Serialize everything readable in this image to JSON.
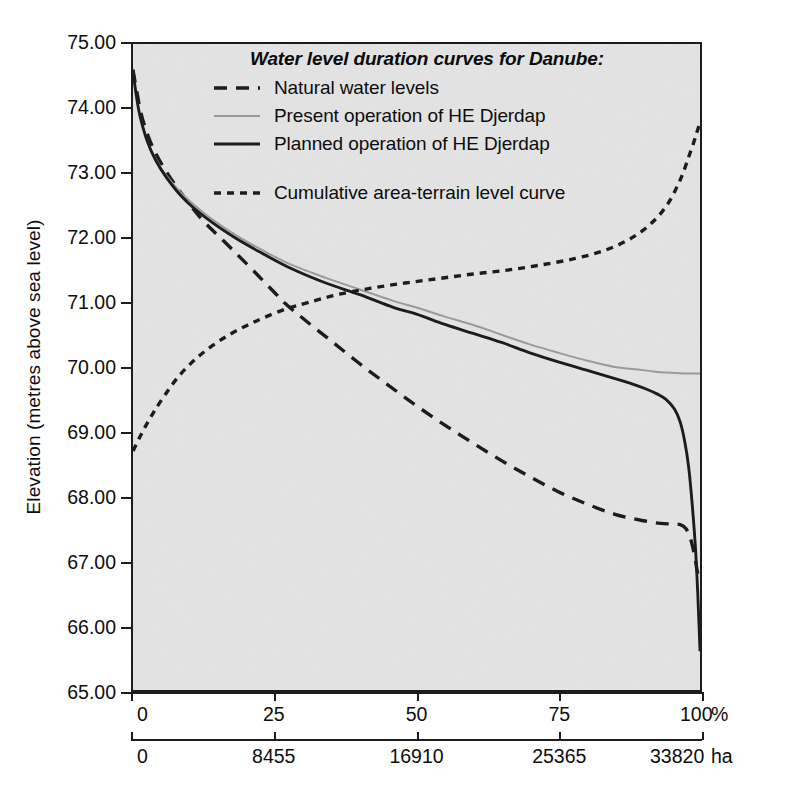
{
  "figure": {
    "ylabel": "Elevation (metres above sea level)",
    "legend_title": "Water level duration curves for Danube:",
    "pct_unit": "%",
    "ha_unit": "ha"
  },
  "legend": {
    "items": [
      {
        "label": "Natural water levels",
        "style": "long-dash",
        "color": "#1c1c1c"
      },
      {
        "label": "Present operation of HE Djerdap",
        "style": "thin-solid",
        "color": "#9a9a9a"
      },
      {
        "label": "Planned operation of HE Djerdap",
        "style": "thick-solid",
        "color": "#1c1c1c"
      },
      {
        "label": "Cumulative area-terrain level curve",
        "style": "short-dash",
        "color": "#1c1c1c"
      }
    ]
  },
  "chart_data": {
    "type": "line",
    "title": "Water level duration curves for Danube:",
    "xlabel": "",
    "ylabel": "Elevation (metres above sea level)",
    "xlim": [
      0,
      100
    ],
    "ylim": [
      65.0,
      75.0
    ],
    "grid": false,
    "legend_position": "top-right-inside",
    "background_color": "#e4e4e4",
    "axes": {
      "y": {
        "unit": "m a.s.l.",
        "ticks": [
          65.0,
          66.0,
          67.0,
          68.0,
          69.0,
          70.0,
          71.0,
          72.0,
          73.0,
          74.0,
          75.0
        ],
        "tick_labels": [
          "65.00",
          "66.00",
          "67.00",
          "68.00",
          "69.00",
          "70.00",
          "71.00",
          "72.00",
          "73.00",
          "74.00",
          "75.00"
        ]
      },
      "x_primary": {
        "unit": "%",
        "ticks": [
          0,
          25,
          50,
          75,
          100
        ],
        "tick_labels": [
          "0",
          "25",
          "50",
          "75",
          "100"
        ]
      },
      "x_secondary": {
        "unit": "ha",
        "ticks": [
          0,
          25,
          50,
          75,
          100
        ],
        "tick_labels": [
          "0",
          "8455",
          "16910",
          "25365",
          "33820"
        ],
        "values": [
          0,
          8455,
          16910,
          25365,
          33820
        ]
      }
    },
    "series": [
      {
        "name": "Natural water levels",
        "style": "long-dash",
        "color": "#1c1c1c",
        "x": [
          0,
          0.6,
          1.5,
          3,
          5,
          8,
          12,
          16,
          20,
          25,
          27,
          30,
          35,
          40,
          45,
          50,
          55,
          60,
          65,
          70,
          75,
          80,
          85,
          90,
          93,
          95,
          96.5,
          97.5,
          98.3,
          99,
          99.5,
          100
        ],
        "y": [
          74.6,
          74.3,
          73.9,
          73.5,
          73.15,
          72.75,
          72.3,
          71.95,
          71.6,
          71.15,
          70.97,
          70.75,
          70.4,
          70.05,
          69.72,
          69.4,
          69.1,
          68.82,
          68.55,
          68.3,
          68.07,
          67.88,
          67.72,
          67.62,
          67.58,
          67.57,
          67.56,
          67.5,
          67.35,
          67.1,
          66.85,
          66.68
        ]
      },
      {
        "name": "Present operation of HE Djerdap",
        "style": "thin-solid",
        "color": "#9a9a9a",
        "x": [
          0,
          0.5,
          1.2,
          2.5,
          4,
          6,
          9,
          13,
          18,
          23,
          28,
          34,
          40,
          46,
          50,
          55,
          60,
          65,
          70,
          75,
          80,
          85,
          88,
          91,
          93,
          95,
          97,
          98.5,
          100
        ],
        "y": [
          74.6,
          74.25,
          73.9,
          73.5,
          73.22,
          72.95,
          72.65,
          72.35,
          72.05,
          71.8,
          71.58,
          71.38,
          71.2,
          71.02,
          70.92,
          70.78,
          70.65,
          70.5,
          70.35,
          70.22,
          70.1,
          70.0,
          69.97,
          69.94,
          69.92,
          69.91,
          69.9,
          69.9,
          69.9
        ]
      },
      {
        "name": "Planned operation of HE Djerdap",
        "style": "thick-solid",
        "color": "#1c1c1c",
        "x": [
          0,
          0.5,
          1.2,
          2.5,
          4,
          6,
          9,
          13,
          18,
          23,
          28,
          34,
          40,
          46,
          50,
          55,
          60,
          65,
          70,
          75,
          80,
          85,
          88,
          90.5,
          92.5,
          94,
          95.5,
          96.5,
          97.3,
          98,
          98.6,
          99.2,
          99.6,
          100
        ],
        "y": [
          74.6,
          74.25,
          73.9,
          73.5,
          73.2,
          72.92,
          72.6,
          72.3,
          72.0,
          71.75,
          71.52,
          71.3,
          71.12,
          70.92,
          70.82,
          70.66,
          70.52,
          70.38,
          70.22,
          70.08,
          69.95,
          69.82,
          69.74,
          69.66,
          69.58,
          69.5,
          69.35,
          69.15,
          68.85,
          68.45,
          67.9,
          67.2,
          66.5,
          65.6
        ]
      },
      {
        "name": "Cumulative area-terrain level curve",
        "style": "short-dash",
        "color": "#1c1c1c",
        "x": [
          0,
          1,
          2,
          3.5,
          5.5,
          8,
          11,
          14,
          17,
          20,
          23,
          27,
          31,
          36,
          42,
          48,
          54,
          60,
          66,
          72,
          78,
          83,
          87,
          90,
          92.5,
          94.5,
          96,
          97,
          98,
          98.8,
          99.4,
          100
        ],
        "y": [
          68.7,
          68.88,
          69.05,
          69.28,
          69.55,
          69.85,
          70.12,
          70.33,
          70.5,
          70.64,
          70.76,
          70.9,
          71.0,
          71.12,
          71.22,
          71.3,
          71.37,
          71.44,
          71.5,
          71.58,
          71.68,
          71.8,
          71.95,
          72.12,
          72.32,
          72.55,
          72.8,
          73.0,
          73.25,
          73.45,
          73.62,
          73.78
        ]
      }
    ]
  }
}
